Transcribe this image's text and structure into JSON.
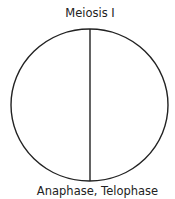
{
  "diagram": {
    "title": "Meiosis I",
    "caption": "Anaphase, Telophase",
    "shape": "circle divided by vertical line",
    "stroke_color": "#222222"
  }
}
